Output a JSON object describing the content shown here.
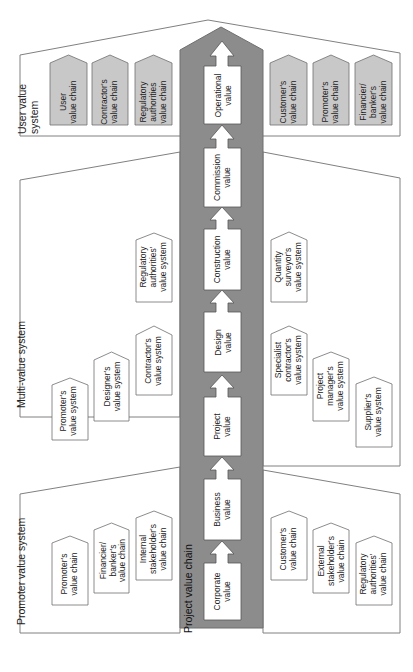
{
  "colors": {
    "panel_stroke": "#808080",
    "column_fill": "#8c8c8c",
    "chain_fill": "#c8c8c8",
    "box_fill": "#ffffff",
    "text": "#222222"
  },
  "project_value_chain": {
    "label": "Project value chain",
    "stages": [
      {
        "id": "operational",
        "label": "Operational\nvalue"
      },
      {
        "id": "commission",
        "label": "Commission\nvalue"
      },
      {
        "id": "construction",
        "label": "Construction\nvalue"
      },
      {
        "id": "design",
        "label": "Design\nvalue"
      },
      {
        "id": "project",
        "label": "Project\nvalue"
      },
      {
        "id": "business",
        "label": "Business\nvalue"
      },
      {
        "id": "corporate",
        "label": "Corporate\nvalue"
      }
    ]
  },
  "user_value_system": {
    "label": "User value\nsystem",
    "left_chains": [
      {
        "label": "User\nvalue chain"
      },
      {
        "label": "Contractor's\nvalue chain"
      },
      {
        "label": "Regulatory\nauthorities\nvalue chain"
      }
    ],
    "right_chains": [
      {
        "label": "Customer's\nvalue chain"
      },
      {
        "label": "Promoter's\nvalue chain"
      },
      {
        "label": "Financier/\nbanker's\nvalue chain"
      }
    ]
  },
  "multi_value_system": {
    "label": "Multi-value system",
    "left_systems": [
      {
        "label": "Promoter's\nvalue system"
      },
      {
        "label": "Designer's\nvalue system"
      },
      {
        "label": "Contractor's\nvalue system"
      },
      {
        "label": "Regulatory\nauthorities'\nvalue system"
      }
    ],
    "right_systems": [
      {
        "label": "Quantity\nsurveyor's\nvalue system"
      },
      {
        "label": "Specialist\ncontractor's\nvalue system"
      },
      {
        "label": "Project\nmanager's\nvalue system"
      },
      {
        "label": "Supplier's\nvalue system"
      }
    ]
  },
  "promoter_value_system": {
    "label": "Promoter value system",
    "left_chains": [
      {
        "label": "Promoter's\nvalue chain"
      },
      {
        "label": "Financier/\nbanker's\nvalue chain"
      },
      {
        "label": "Internal\nstakeholder's\nvalue chain"
      }
    ],
    "right_chains": [
      {
        "label": "Customer's\nvalue chain"
      },
      {
        "label": "External\nstakeholder's\nvalue chain"
      },
      {
        "label": "Regulatory\nauthorities'\nvalue chain"
      }
    ]
  }
}
